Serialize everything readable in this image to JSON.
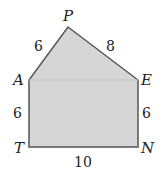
{
  "diagram": {
    "fill": "#d6d6d6",
    "stroke": "#555555",
    "vertices": {
      "P": {
        "label": "P",
        "x": 68,
        "y": 27
      },
      "A": {
        "label": "A",
        "x": 29,
        "y": 80
      },
      "E": {
        "label": "E",
        "x": 138,
        "y": 80
      },
      "T": {
        "label": "T",
        "x": 29,
        "y": 147
      },
      "N": {
        "label": "N",
        "x": 138,
        "y": 147
      }
    },
    "side_labels": {
      "PA": "6",
      "PE": "8",
      "AT": "6",
      "EN": "6",
      "TN": "10"
    }
  }
}
